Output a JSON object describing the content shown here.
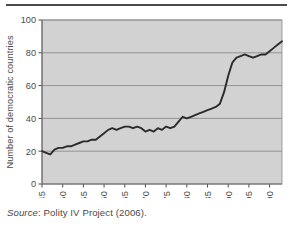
{
  "figure": {
    "source_prefix": "Source",
    "source_text": ": Polity IV Project (2006).",
    "plot_bg_color": "#d2d2d2",
    "line_color": "#2b2b2b",
    "axis_color": "#4a4a4a",
    "grid_color": "#8c8c8c"
  },
  "chart_data": {
    "type": "line",
    "title": "",
    "xlabel": "",
    "ylabel": "Number of democratic countries",
    "xlim": [
      1945,
      2003
    ],
    "ylim": [
      0,
      100
    ],
    "grid": true,
    "legend": "none",
    "yticks": [
      0,
      20,
      40,
      60,
      80,
      100
    ],
    "ytick_labels": [
      "0",
      "20",
      "40",
      "60",
      "80",
      "100"
    ],
    "xticks": [
      1945,
      1950,
      1955,
      1960,
      1965,
      1970,
      1975,
      1980,
      1985,
      1990,
      1995,
      2000
    ],
    "xtick_labels": [
      "1945",
      "1950",
      "1955",
      "1960",
      "1965",
      "1970",
      "1975",
      "1980",
      "1985",
      "1990",
      "1995",
      "2000"
    ],
    "series": [
      {
        "name": "Number of democratic countries",
        "x": [
          1945,
          1946,
          1947,
          1948,
          1949,
          1950,
          1951,
          1952,
          1953,
          1954,
          1955,
          1956,
          1957,
          1958,
          1959,
          1960,
          1961,
          1962,
          1963,
          1964,
          1965,
          1966,
          1967,
          1968,
          1969,
          1970,
          1971,
          1972,
          1973,
          1974,
          1975,
          1976,
          1977,
          1978,
          1979,
          1980,
          1981,
          1982,
          1983,
          1984,
          1985,
          1986,
          1987,
          1988,
          1989,
          1990,
          1991,
          1992,
          1993,
          1994,
          1995,
          1996,
          1997,
          1998,
          1999,
          2000,
          2001,
          2002,
          2003
        ],
        "values": [
          20,
          19,
          18,
          21,
          22,
          22,
          23,
          23,
          24,
          25,
          26,
          26,
          27,
          27,
          29,
          31,
          33,
          34,
          33,
          34,
          35,
          35,
          34,
          35,
          34,
          32,
          33,
          32,
          34,
          33,
          35,
          34,
          35,
          38,
          41,
          40,
          41,
          42,
          43,
          44,
          45,
          46,
          47,
          49,
          56,
          66,
          74,
          77,
          78,
          79,
          78,
          77,
          78,
          79,
          79,
          81,
          83,
          85,
          87
        ]
      }
    ]
  }
}
